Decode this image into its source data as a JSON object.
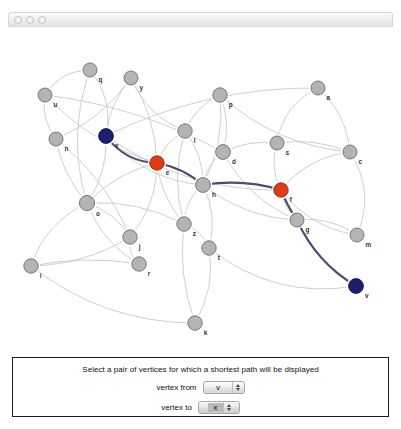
{
  "window": {
    "controls": [
      "close-dot",
      "minimize-dot",
      "zoom-dot"
    ]
  },
  "graph": {
    "normal_color": "#b4b4b4",
    "endpoint_color": "#1b1f6e",
    "waypoint_color": "#dd3c14",
    "edge_color": "#c9c9c9",
    "path_color": "#4a4d72",
    "vertices": [
      {
        "id": "q",
        "label": "q",
        "x": 90,
        "y": 30,
        "r": 7.0,
        "state": "normal"
      },
      {
        "id": "u",
        "label": "u",
        "x": 45,
        "y": 55,
        "r": 7.0,
        "state": "normal"
      },
      {
        "id": "y",
        "label": "y",
        "x": 131,
        "y": 38,
        "r": 7.0,
        "state": "normal"
      },
      {
        "id": "p",
        "label": "p",
        "x": 220,
        "y": 55,
        "r": 7.2,
        "state": "normal"
      },
      {
        "id": "a",
        "label": "a",
        "x": 318,
        "y": 48,
        "r": 7.0,
        "state": "normal"
      },
      {
        "id": "n",
        "label": "n",
        "x": 56,
        "y": 99,
        "r": 7.0,
        "state": "normal"
      },
      {
        "id": "l",
        "label": "l",
        "x": 185,
        "y": 91,
        "r": 7.2,
        "state": "normal"
      },
      {
        "id": "x",
        "label": "x",
        "x": 106,
        "y": 96,
        "r": 7.4,
        "state": "endpoint"
      },
      {
        "id": "d",
        "label": "d",
        "x": 223,
        "y": 112,
        "r": 7.4,
        "state": "normal"
      },
      {
        "id": "s",
        "label": "s",
        "x": 277,
        "y": 103,
        "r": 7.0,
        "state": "normal"
      },
      {
        "id": "c",
        "label": "c",
        "x": 350,
        "y": 112,
        "r": 7.0,
        "state": "normal"
      },
      {
        "id": "e",
        "label": "e",
        "x": 157,
        "y": 123,
        "r": 7.2,
        "state": "waypoint"
      },
      {
        "id": "h",
        "label": "h",
        "x": 203,
        "y": 145,
        "r": 7.4,
        "state": "normal"
      },
      {
        "id": "f",
        "label": "f",
        "x": 281,
        "y": 150,
        "r": 7.2,
        "state": "waypoint"
      },
      {
        "id": "o",
        "label": "o",
        "x": 87,
        "y": 163,
        "r": 7.6,
        "state": "normal"
      },
      {
        "id": "g",
        "label": "g",
        "x": 297,
        "y": 180,
        "r": 7.0,
        "state": "normal"
      },
      {
        "id": "j",
        "label": "j",
        "x": 130,
        "y": 197,
        "r": 7.2,
        "state": "normal"
      },
      {
        "id": "z",
        "label": "z",
        "x": 184,
        "y": 184,
        "r": 7.2,
        "state": "normal"
      },
      {
        "id": "t",
        "label": "t",
        "x": 209,
        "y": 208,
        "r": 7.2,
        "state": "normal"
      },
      {
        "id": "m",
        "label": "m",
        "x": 357,
        "y": 195,
        "r": 7.0,
        "state": "normal"
      },
      {
        "id": "r",
        "label": "r",
        "x": 139,
        "y": 224,
        "r": 7.2,
        "state": "normal"
      },
      {
        "id": "i",
        "label": "i",
        "x": 31,
        "y": 226,
        "r": 7.2,
        "state": "normal"
      },
      {
        "id": "v",
        "label": "v",
        "x": 356,
        "y": 246,
        "r": 7.4,
        "state": "endpoint"
      },
      {
        "id": "k",
        "label": "k",
        "x": 195,
        "y": 283,
        "r": 7.2,
        "state": "normal"
      }
    ],
    "edges": [
      {
        "from": "q",
        "to": "u",
        "bend": 14
      },
      {
        "from": "q",
        "to": "x",
        "bend": -16
      },
      {
        "from": "q",
        "to": "o",
        "bend": 22
      },
      {
        "from": "u",
        "to": "n",
        "bend": 10
      },
      {
        "from": "u",
        "to": "d",
        "bend": -18
      },
      {
        "from": "u",
        "to": "e",
        "bend": 18
      },
      {
        "from": "y",
        "to": "x",
        "bend": 10
      },
      {
        "from": "y",
        "to": "n",
        "bend": -14
      },
      {
        "from": "y",
        "to": "e",
        "bend": -12
      },
      {
        "from": "y",
        "to": "l",
        "bend": 16
      },
      {
        "from": "p",
        "to": "l",
        "bend": 10
      },
      {
        "from": "p",
        "to": "d",
        "bend": -10
      },
      {
        "from": "p",
        "to": "c",
        "bend": 24
      },
      {
        "from": "p",
        "to": "h",
        "bend": -14
      },
      {
        "from": "a",
        "to": "c",
        "bend": -14
      },
      {
        "from": "a",
        "to": "x",
        "bend": 26
      },
      {
        "from": "a",
        "to": "s",
        "bend": 18
      },
      {
        "from": "n",
        "to": "o",
        "bend": 10
      },
      {
        "from": "n",
        "to": "j",
        "bend": -16
      },
      {
        "from": "l",
        "to": "e",
        "bend": 8
      },
      {
        "from": "l",
        "to": "h",
        "bend": -10
      },
      {
        "from": "l",
        "to": "z",
        "bend": 14
      },
      {
        "from": "x",
        "to": "o",
        "bend": -12
      },
      {
        "from": "x",
        "to": "h",
        "bend": 22
      },
      {
        "from": "x",
        "to": "f",
        "bend": 30
      },
      {
        "from": "d",
        "to": "h",
        "bend": 8
      },
      {
        "from": "d",
        "to": "s",
        "bend": -8
      },
      {
        "from": "d",
        "to": "g",
        "bend": 18
      },
      {
        "from": "s",
        "to": "c",
        "bend": -10
      },
      {
        "from": "s",
        "to": "f",
        "bend": 10
      },
      {
        "from": "c",
        "to": "f",
        "bend": 16
      },
      {
        "from": "c",
        "to": "m",
        "bend": -22
      },
      {
        "from": "e",
        "to": "o",
        "bend": 12
      },
      {
        "from": "e",
        "to": "j",
        "bend": -14
      },
      {
        "from": "e",
        "to": "z",
        "bend": 10
      },
      {
        "from": "e",
        "to": "h",
        "bend": -8
      },
      {
        "from": "h",
        "to": "z",
        "bend": 10
      },
      {
        "from": "h",
        "to": "t",
        "bend": -12
      },
      {
        "from": "h",
        "to": "g",
        "bend": 16
      },
      {
        "from": "f",
        "to": "g",
        "bend": 6
      },
      {
        "from": "f",
        "to": "m",
        "bend": 18
      },
      {
        "from": "o",
        "to": "i",
        "bend": 18
      },
      {
        "from": "o",
        "to": "j",
        "bend": -10
      },
      {
        "from": "o",
        "to": "r",
        "bend": 14
      },
      {
        "from": "o",
        "to": "z",
        "bend": -14
      },
      {
        "from": "g",
        "to": "m",
        "bend": -12
      },
      {
        "from": "j",
        "to": "i",
        "bend": -14
      },
      {
        "from": "j",
        "to": "r",
        "bend": 8
      },
      {
        "from": "z",
        "to": "t",
        "bend": -8
      },
      {
        "from": "z",
        "to": "k",
        "bend": 12
      },
      {
        "from": "t",
        "to": "k",
        "bend": -14
      },
      {
        "from": "t",
        "to": "v",
        "bend": 34
      },
      {
        "from": "r",
        "to": "i",
        "bend": 10
      },
      {
        "from": "i",
        "to": "k",
        "bend": 30
      }
    ],
    "shortest_path": {
      "vertices": [
        "x",
        "e",
        "h",
        "f",
        "g",
        "v"
      ],
      "segments": [
        {
          "from": "x",
          "to": "e",
          "bend": 14
        },
        {
          "from": "e",
          "to": "h",
          "bend": -7
        },
        {
          "from": "h",
          "to": "f",
          "bend": -9
        },
        {
          "from": "f",
          "to": "g",
          "bend": 2
        },
        {
          "from": "g",
          "to": "v",
          "bend": 14
        }
      ]
    }
  },
  "control_panel": {
    "instruction": "Select a pair of vertices for which a shortest path will be displayed",
    "from_label": "vertex from",
    "to_label": "vertex to",
    "from_value": "v",
    "to_value": "x",
    "options": [
      "a",
      "c",
      "d",
      "e",
      "f",
      "g",
      "h",
      "i",
      "j",
      "k",
      "l",
      "m",
      "n",
      "o",
      "p",
      "q",
      "r",
      "s",
      "t",
      "u",
      "v",
      "x",
      "y",
      "z"
    ]
  }
}
